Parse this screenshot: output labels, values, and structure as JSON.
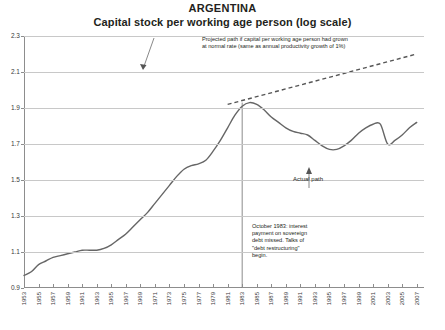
{
  "title": {
    "country": "ARGENTINA",
    "subtitle": "Capital stock per working age person (log scale)"
  },
  "annotations": {
    "projected": "Projected path if capital per working age person had grown at normal rate (same as annual productivity growth of 1%)",
    "event": "October 1983: interest payment on sovereign debt missed. Talks of \"debt restructuring\" begin.",
    "actual": "Actual path"
  },
  "chart_data": {
    "type": "line",
    "xlabel": "",
    "ylabel": "",
    "ylim": [
      0.9,
      2.3
    ],
    "ytick_step": 0.2,
    "ytick_labels": [
      "0.9",
      "1.1",
      "1.3",
      "1.5",
      "1.7",
      "1.9",
      "2.1",
      "2.3"
    ],
    "xlim": [
      1953,
      2008
    ],
    "xtick_labels": [
      "1953",
      "1955",
      "1957",
      "1959",
      "1961",
      "1963",
      "1965",
      "1967",
      "1969",
      "1971",
      "1973",
      "1975",
      "1977",
      "1979",
      "1981",
      "1983",
      "1985",
      "1987",
      "1989",
      "1991",
      "1993",
      "1995",
      "1997",
      "1999",
      "2001",
      "2003",
      "2005",
      "2007"
    ],
    "grid": "horizontal",
    "legend": "none",
    "event_marker_year": 1983,
    "series": [
      {
        "name": "Actual path",
        "style": "solid",
        "color": "#666666",
        "x": [
          1953,
          1954,
          1955,
          1956,
          1957,
          1958,
          1959,
          1960,
          1961,
          1962,
          1963,
          1964,
          1965,
          1966,
          1967,
          1968,
          1969,
          1970,
          1971,
          1972,
          1973,
          1974,
          1975,
          1976,
          1977,
          1978,
          1979,
          1980,
          1981,
          1982,
          1983,
          1984,
          1985,
          1986,
          1987,
          1988,
          1989,
          1990,
          1991,
          1992,
          1993,
          1994,
          1995,
          1996,
          1997,
          1998,
          1999,
          2000,
          2001,
          2002,
          2003,
          2004,
          2005,
          2006,
          2007
        ],
        "values": [
          0.97,
          0.99,
          1.03,
          1.05,
          1.07,
          1.08,
          1.09,
          1.1,
          1.11,
          1.11,
          1.11,
          1.12,
          1.14,
          1.17,
          1.2,
          1.24,
          1.28,
          1.32,
          1.37,
          1.42,
          1.47,
          1.52,
          1.56,
          1.58,
          1.59,
          1.61,
          1.66,
          1.72,
          1.79,
          1.86,
          1.91,
          1.93,
          1.92,
          1.89,
          1.85,
          1.82,
          1.79,
          1.77,
          1.76,
          1.75,
          1.72,
          1.69,
          1.67,
          1.67,
          1.69,
          1.72,
          1.76,
          1.79,
          1.81,
          1.81,
          1.79,
          1.75,
          1.71,
          1.7,
          1.7
        ],
        "recent_tail_x": [
          2003,
          2004,
          2005,
          2006,
          2007
        ],
        "recent_tail_values": [
          1.7,
          1.72,
          1.75,
          1.79,
          1.82
        ]
      },
      {
        "name": "Projected path",
        "style": "dashed",
        "color": "#555555",
        "x": [
          1981,
          2007
        ],
        "values": [
          1.92,
          2.2
        ]
      }
    ]
  }
}
